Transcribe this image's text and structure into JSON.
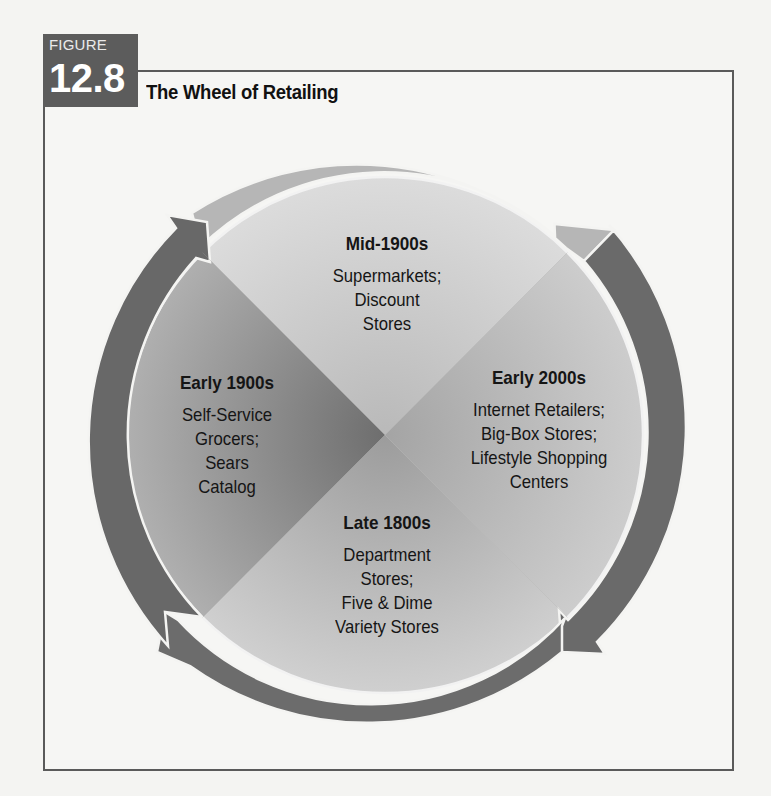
{
  "figure": {
    "label": "FIGURE",
    "number": "12.8",
    "title": "The Wheel of Retailing"
  },
  "colors": {
    "badge": "#5c5c5c",
    "frame": "#5a5a5a",
    "ring_light": "#b4b4b4",
    "ring_dark": "#6a6a6a",
    "quadrant_top": "#d2d2d2",
    "quadrant_left": "#8c8c8c",
    "quadrant_right": "#b8b8b8",
    "quadrant_bottom": "#bdbdbd"
  },
  "wheel": {
    "direction": "clockwise",
    "quadrants": [
      {
        "position": "top",
        "era": "Mid-1900s",
        "lines": [
          "Supermarkets;",
          "Discount",
          "Stores"
        ]
      },
      {
        "position": "right",
        "era": "Early 2000s",
        "lines": [
          "Internet Retailers;",
          "Big-Box Stores;",
          "Lifestyle Shopping",
          "Centers"
        ]
      },
      {
        "position": "bottom",
        "era": "Late 1800s",
        "lines": [
          "Department",
          "Stores;",
          "Five & Dime",
          "Variety Stores"
        ]
      },
      {
        "position": "left",
        "era": "Early 1900s",
        "lines": [
          "Self-Service",
          "Grocers;",
          "Sears",
          "Catalog"
        ]
      }
    ]
  }
}
